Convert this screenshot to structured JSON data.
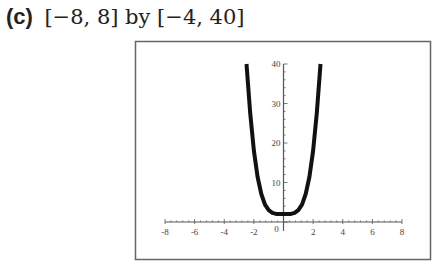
{
  "caption": {
    "label": "(c)",
    "window_text": "[−8, 8] by [−4, 40]"
  },
  "chart_data": {
    "type": "line",
    "title": "",
    "xlabel": "",
    "ylabel": "",
    "xlim": [
      -8,
      8
    ],
    "ylim": [
      -4,
      40
    ],
    "x_ticks": [
      -8,
      -6,
      -4,
      -2,
      0,
      2,
      4,
      6,
      8
    ],
    "y_ticks": [
      10,
      20,
      30,
      40
    ],
    "grid": false,
    "legend": null,
    "series": [
      {
        "name": "curve",
        "description": "U-shaped quartic-like curve, minimum about 2 near x=0, reaching 40 near x=±2.5",
        "x": [
          -2.5,
          -2.25,
          -2.0,
          -1.75,
          -1.5,
          -1.25,
          -1.0,
          -0.75,
          -0.5,
          -0.25,
          0,
          0.25,
          0.5,
          0.75,
          1.0,
          1.25,
          1.5,
          1.75,
          2.0,
          2.25,
          2.5
        ],
        "y": [
          40,
          27.6,
          18,
          11.4,
          7.1,
          4.4,
          3,
          2.3,
          2.06,
          2.0,
          2,
          2.0,
          2.06,
          2.3,
          3,
          4.4,
          7.1,
          11.4,
          18,
          27.6,
          40
        ]
      }
    ]
  },
  "colors": {
    "curve": "#111111",
    "axis": "#555555",
    "frame": "#666666"
  }
}
